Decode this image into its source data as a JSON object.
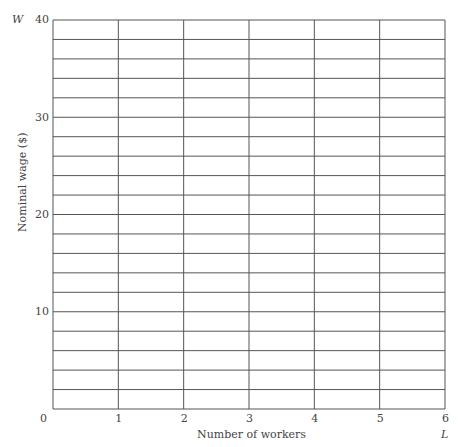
{
  "chart_data": {
    "type": "line",
    "title": "",
    "xlabel": "Number of workers",
    "ylabel": "Nominal wage ($)",
    "x_axis_symbol": "L",
    "y_axis_symbol": "W",
    "x_ticks": [
      "0",
      "1",
      "2",
      "3",
      "4",
      "5",
      "6"
    ],
    "y_ticks": [
      "10",
      "20",
      "30",
      "40"
    ],
    "xlim": [
      0,
      6
    ],
    "ylim": [
      0,
      40
    ],
    "grid": true,
    "grid_minor_y_step": 2,
    "grid_x_step": 1,
    "series": []
  }
}
